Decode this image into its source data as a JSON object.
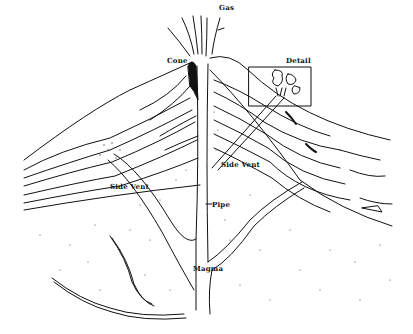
{
  "diagram": {
    "colors": {
      "ink": "#111111",
      "background": "#ffffff"
    },
    "labels": {
      "gas": "Gas",
      "cone": "Cone",
      "detail": "Detail",
      "side_vent_left": "Side Vent",
      "side_vent_right": "Side Vent",
      "pipe": "Pipe",
      "magma": "Magma"
    }
  }
}
